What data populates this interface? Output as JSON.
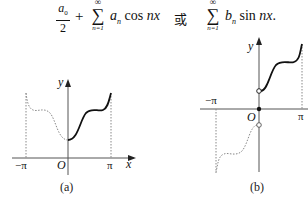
{
  "formula": {
    "part1": {
      "frac_num": "a",
      "frac_num_sub": "0",
      "frac_den": "2",
      "plus": "+",
      "sum_upper": "∞",
      "sum_symbol": "∑",
      "sum_lower": "n=1",
      "term_coef": "a",
      "term_coef_sub": "n",
      "term_func": "cos",
      "term_arg": "nx"
    },
    "connector": "或",
    "part2": {
      "sum_upper": "∞",
      "sum_symbol": "∑",
      "sum_lower": "n=1",
      "term_coef": "b",
      "term_coef_sub": "n",
      "term_func": "sin",
      "term_arg": "nx",
      "end": "."
    }
  },
  "figures": [
    {
      "id": "a",
      "caption": "(a)",
      "y_label": "y",
      "x_label": "x",
      "origin_label": "O",
      "neg_pi_label": "−π",
      "pi_label": "π",
      "description": "even extension: solid curve on (0,π], dotted mirror on [−π,0)"
    },
    {
      "id": "b",
      "caption": "(b)",
      "y_label": "y",
      "origin_label": "O",
      "neg_pi_label": "−π",
      "pi_label": "π",
      "description": "odd extension: solid curve on (0,π] with open circle at 0+, dotted point-reflection on [−π,0) with open circle at 0−, filled dot at origin"
    }
  ],
  "colors": {
    "ink": "#111111",
    "dotted": "#888888",
    "background": "#ffffff"
  }
}
